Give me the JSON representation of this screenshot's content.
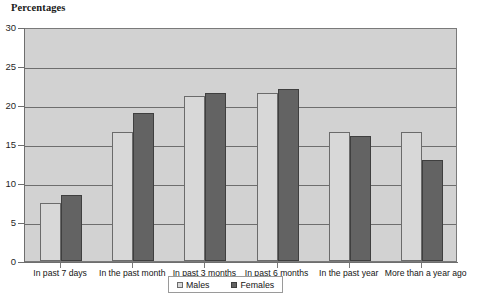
{
  "chart_data": {
    "type": "bar",
    "title": "Percentages",
    "xlabel": "",
    "ylabel": "Percentages",
    "ylim": [
      0,
      30
    ],
    "yticks": [
      0,
      5,
      10,
      15,
      20,
      25,
      30
    ],
    "ytick_labels": [
      "0",
      "5",
      "10",
      "15",
      "20",
      "25",
      "30"
    ],
    "grid": true,
    "legend_position": "bottom-center",
    "categories": [
      "In past 7 days",
      "In the past month",
      "In past 3 months",
      "In past 6 months",
      "In the past year",
      "More than a year ago"
    ],
    "series": [
      {
        "name": "Males",
        "color": "#d8d8d8",
        "values": [
          7.5,
          16.5,
          21.2,
          21.6,
          16.5,
          16.5
        ]
      },
      {
        "name": "Females",
        "color": "#636363",
        "values": [
          8.5,
          19.0,
          21.6,
          22.1,
          16.0,
          13.0
        ]
      }
    ]
  }
}
